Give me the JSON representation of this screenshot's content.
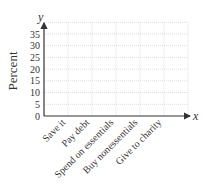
{
  "chart_data": {
    "type": "bar",
    "title": "",
    "xlabel": "x",
    "ylabel": "Percent",
    "y_axis_letter": "y",
    "categories": [
      "Save it",
      "Pay debt",
      "Spend on essentials",
      "Buy nonessentials",
      "Give to charity"
    ],
    "values": [
      null,
      null,
      null,
      null,
      null
    ],
    "yticks": [
      "0",
      "5",
      "10",
      "15",
      "20",
      "25",
      "30",
      "35"
    ],
    "ylim": [
      0,
      40
    ],
    "grid": true,
    "legend": null
  }
}
